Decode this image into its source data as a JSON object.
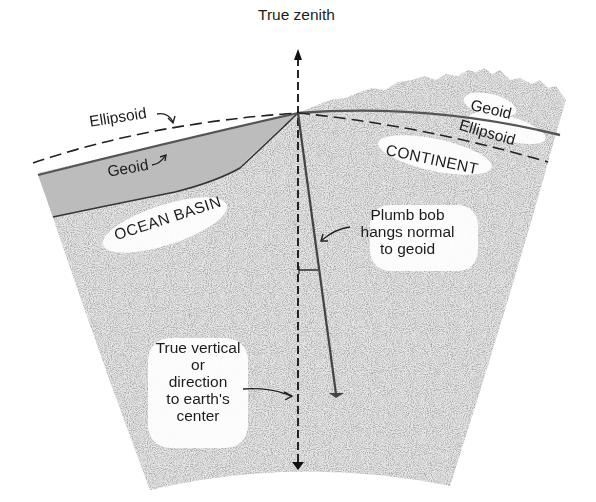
{
  "diagram": {
    "labels": {
      "true_zenith": "True zenith",
      "ellipsoid_left": "Ellipsoid",
      "geoid_left": "Geoid",
      "ocean_basin": "OCEAN BASIN",
      "geoid_right": "Geoid",
      "ellipsoid_right": "Ellipsoid",
      "continent": "CONTINENT",
      "plumb_bob": [
        "Plumb bob",
        "hangs normal",
        "to geoid"
      ],
      "true_vertical": [
        "True vertical",
        "or",
        "direction",
        "to earth's",
        "center"
      ]
    },
    "colors": {
      "background": "#ffffff",
      "crust_stipple": "#d8d8d8",
      "ocean_fill": "#bdbdbd",
      "line_dark": "#222222",
      "geoid_line": "#555555"
    }
  }
}
